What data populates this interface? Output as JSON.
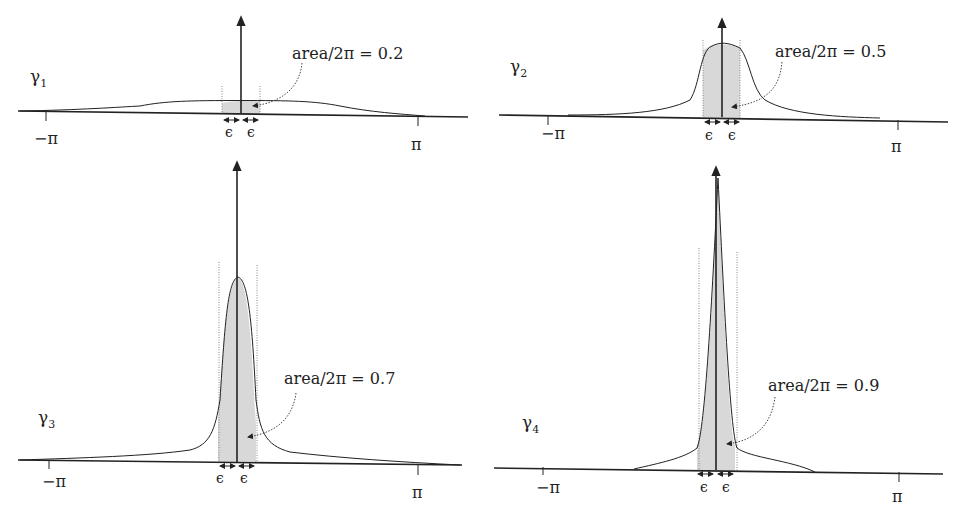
{
  "figure": {
    "panels": [
      {
        "id": "gamma1",
        "name": "γ",
        "subscript": "1",
        "annotation": "area/2π = 0.2",
        "left_tick": "−π",
        "right_tick": "π",
        "eps_left": "ϵ",
        "eps_right": "ϵ"
      },
      {
        "id": "gamma2",
        "name": "γ",
        "subscript": "2",
        "annotation": "area/2π = 0.5",
        "left_tick": "−π",
        "right_tick": "π",
        "eps_left": "ϵ",
        "eps_right": "ϵ"
      },
      {
        "id": "gamma3",
        "name": "γ",
        "subscript": "3",
        "annotation": "area/2π = 0.7",
        "left_tick": "−π",
        "right_tick": "π",
        "eps_left": "ϵ",
        "eps_right": "ϵ"
      },
      {
        "id": "gamma4",
        "name": "γ",
        "subscript": "4",
        "annotation": "area/2π = 0.9",
        "left_tick": "−π",
        "right_tick": "π",
        "eps_left": "ϵ",
        "eps_right": "ϵ"
      }
    ],
    "colors": {
      "line": "#222222",
      "shade": "#d8d8d8",
      "dotted": "#888888"
    }
  }
}
